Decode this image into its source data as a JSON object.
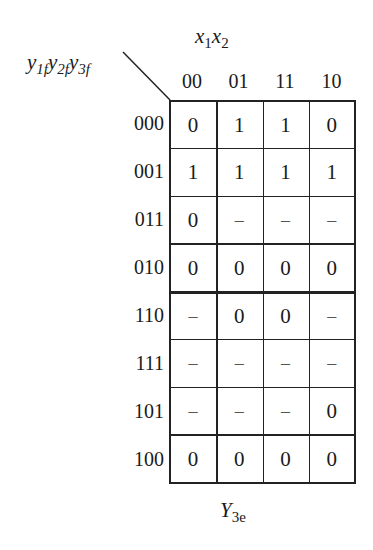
{
  "kmap": {
    "column_variables": "x1x2",
    "row_variables": "y1f y2f y3f",
    "column_labels": [
      "00",
      "01",
      "11",
      "10"
    ],
    "row_labels": [
      "000",
      "001",
      "011",
      "010",
      "110",
      "111",
      "101",
      "100"
    ],
    "cells": [
      [
        "0",
        "1",
        "1",
        "0"
      ],
      [
        "1",
        "1",
        "1",
        "1"
      ],
      [
        "0",
        "–",
        "–",
        "–"
      ],
      [
        "0",
        "0",
        "0",
        "0"
      ],
      [
        "–",
        "0",
        "0",
        "–"
      ],
      [
        "–",
        "–",
        "–",
        "–"
      ],
      [
        "–",
        "–",
        "–",
        "0"
      ],
      [
        "0",
        "0",
        "0",
        "0"
      ]
    ],
    "thick_divider_after_row": 3,
    "caption": "Y3e"
  },
  "labels": {
    "x1": "x",
    "x1_sub": "1",
    "x2": "x",
    "x2_sub": "2",
    "y1": "y",
    "y1_sub": "1f",
    "y2": "y",
    "y2_sub": "2f",
    "y3": "y",
    "y3_sub": "3f",
    "caption_main": "Y",
    "caption_sub": "3e"
  }
}
